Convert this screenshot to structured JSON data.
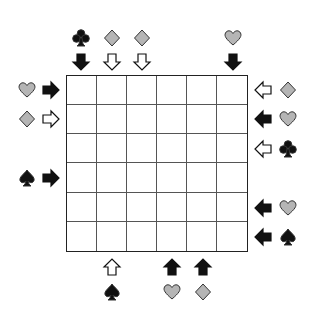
{
  "puzzle": {
    "grid": {
      "rows": 6,
      "cols": 6
    },
    "colors": {
      "black": "#111111",
      "gray": "#b5b5b5",
      "outline": "#333333",
      "white": "#ffffff"
    },
    "top": [
      {
        "col": 0,
        "suit": "club",
        "suit_fill": "black",
        "arrow": "down",
        "arrow_fill": "black"
      },
      {
        "col": 1,
        "suit": "diamond",
        "suit_fill": "gray",
        "arrow": "down",
        "arrow_fill": "white"
      },
      {
        "col": 2,
        "suit": "diamond",
        "suit_fill": "gray",
        "arrow": "down",
        "arrow_fill": "white"
      },
      {
        "col": 5,
        "suit": "heart",
        "suit_fill": "gray",
        "arrow": "down",
        "arrow_fill": "black"
      }
    ],
    "left": [
      {
        "row": 0,
        "suit": "heart",
        "suit_fill": "gray",
        "arrow": "right",
        "arrow_fill": "black"
      },
      {
        "row": 1,
        "suit": "diamond",
        "suit_fill": "gray",
        "arrow": "right",
        "arrow_fill": "white"
      },
      {
        "row": 3,
        "suit": "spade",
        "suit_fill": "black",
        "arrow": "right",
        "arrow_fill": "black"
      }
    ],
    "right": [
      {
        "row": 0,
        "suit": "diamond",
        "suit_fill": "gray",
        "arrow": "left",
        "arrow_fill": "white"
      },
      {
        "row": 1,
        "suit": "heart",
        "suit_fill": "gray",
        "arrow": "left",
        "arrow_fill": "black"
      },
      {
        "row": 2,
        "suit": "club",
        "suit_fill": "black",
        "arrow": "left",
        "arrow_fill": "white"
      },
      {
        "row": 4,
        "suit": "heart",
        "suit_fill": "gray",
        "arrow": "left",
        "arrow_fill": "black"
      },
      {
        "row": 5,
        "suit": "spade",
        "suit_fill": "black",
        "arrow": "left",
        "arrow_fill": "black"
      }
    ],
    "bottom": [
      {
        "col": 1,
        "suit": "spade",
        "suit_fill": "black",
        "arrow": "up",
        "arrow_fill": "white"
      },
      {
        "col": 3,
        "suit": "heart",
        "suit_fill": "gray",
        "arrow": "up",
        "arrow_fill": "black"
      },
      {
        "col": 4,
        "suit": "diamond",
        "suit_fill": "gray",
        "arrow": "up",
        "arrow_fill": "black"
      }
    ]
  }
}
